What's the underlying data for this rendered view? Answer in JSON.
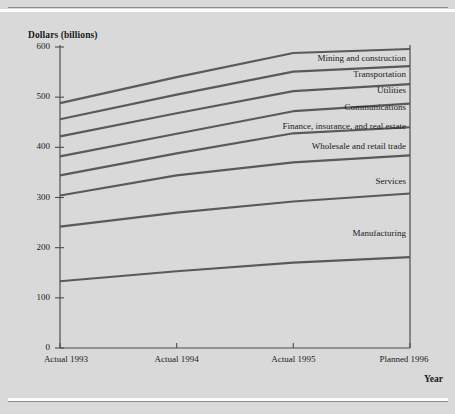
{
  "chart_data": {
    "type": "line",
    "title": "",
    "subtitle": "",
    "ylabel": "Dollars (billions)",
    "xlabel": "Year",
    "categories": [
      "Actual 1993",
      "Actual 1994",
      "Actual 1995",
      "Planned 1996"
    ],
    "x_tick_labels": [
      "Actual 1993",
      "Actual 1994",
      "Actual 1995",
      "Planned 1996"
    ],
    "y_tick_labels": [
      "0",
      "100",
      "200",
      "300",
      "400",
      "500",
      "600"
    ],
    "y_ticks": [
      0,
      100,
      200,
      300,
      400,
      500,
      600
    ],
    "ylim": [
      0,
      600
    ],
    "grid": false,
    "legend_position": "inline-right-of-line",
    "line_color": "#5a5a5a",
    "axis_color": "#4d4d4d",
    "background_color": "#d9d9d9",
    "series": [
      {
        "name": "Mining and construction",
        "values": [
          488,
          540,
          588,
          596
        ]
      },
      {
        "name": "Transportation",
        "values": [
          456,
          505,
          551,
          562
        ]
      },
      {
        "name": "Utilities",
        "values": [
          422,
          468,
          512,
          526
        ]
      },
      {
        "name": "Communications",
        "values": [
          382,
          427,
          472,
          487
        ]
      },
      {
        "name": "Finance, insurance, and real estate",
        "values": [
          344,
          388,
          428,
          440
        ]
      },
      {
        "name": "Wholesale and retail trade",
        "values": [
          304,
          344,
          370,
          384
        ]
      },
      {
        "name": "Services",
        "values": [
          242,
          270,
          292,
          308
        ]
      },
      {
        "name": "Manufacturing",
        "values": [
          133,
          153,
          170,
          181
        ]
      }
    ],
    "series_label_values": [
      576,
      545,
      512,
      478,
      440,
      400,
      330,
      228
    ]
  }
}
